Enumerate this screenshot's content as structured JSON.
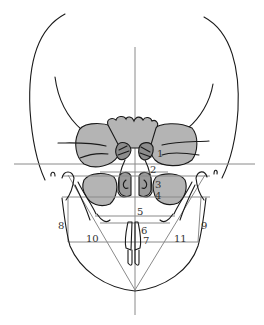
{
  "figure": {
    "colors": {
      "outline": "#1a1a1a",
      "fill": "#b4b4b4",
      "fill_dark": "#8c8c8c",
      "guide_lines": "#8a8a8a",
      "background": "#ffffff"
    },
    "labels": [
      {
        "id": "1",
        "text": "1"
      },
      {
        "id": "2",
        "text": "2"
      },
      {
        "id": "3",
        "text": "3"
      },
      {
        "id": "4",
        "text": "4"
      },
      {
        "id": "5",
        "text": "5"
      },
      {
        "id": "6",
        "text": "6"
      },
      {
        "id": "7",
        "text": "7"
      },
      {
        "id": "8",
        "text": "8"
      },
      {
        "id": "9",
        "text": "9"
      },
      {
        "id": "10",
        "text": "10"
      },
      {
        "id": "11",
        "text": "11"
      }
    ]
  }
}
